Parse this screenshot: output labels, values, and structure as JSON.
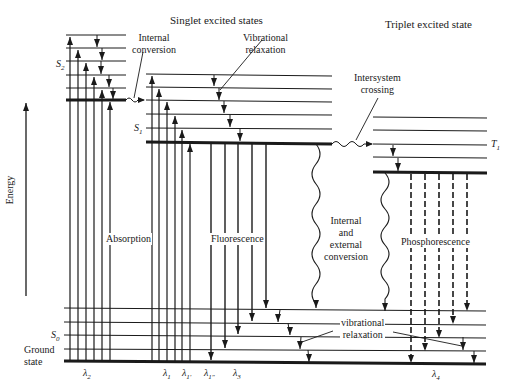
{
  "diagram": {
    "type": "Jablonski energy-level diagram",
    "headers": {
      "singlet": "Singlet excited states",
      "triplet": "Triplet excited state"
    },
    "axis": {
      "label": "Energy"
    },
    "states": {
      "s2": "S",
      "s2_sub": "2",
      "s1": "S",
      "s1_sub": "1",
      "t1": "T",
      "t1_sub": "1",
      "s0": "S",
      "s0_sub": "0",
      "ground_line1": "Ground",
      "ground_line2": "state"
    },
    "processes": {
      "internal_conversion_1": "Internal",
      "internal_conversion_2": "conversion",
      "vib_relax_top_1": "Vibrational",
      "vib_relax_top_2": "relaxation",
      "isc_1": "Intersystem",
      "isc_2": "crossing",
      "absorption": "Absorption",
      "fluorescence": "Fluorescence",
      "iec_1": "Internal",
      "iec_2": "and",
      "iec_3": "external",
      "iec_4": "conversion",
      "phosphorescence": "Phosphorescence",
      "vib_relax_bottom_1": "vibrational",
      "vib_relax_bottom_2": "relaxation"
    },
    "wavelengths": {
      "l2": "λ",
      "l2_sub": "2",
      "l1": "λ",
      "l1_sub": "1",
      "l1p": "λ",
      "l1p_sub": "1′",
      "l1pp": "λ",
      "l1pp_sub": "1″",
      "l3": "λ",
      "l3_sub": "3",
      "l4": "λ",
      "l4_sub": "4"
    },
    "colors": {
      "line": "#1a1a1a",
      "background": "#ffffff"
    }
  }
}
